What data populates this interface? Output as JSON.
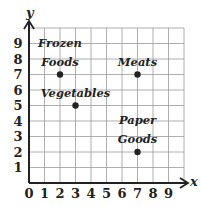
{
  "chart_data": {
    "type": "scatter",
    "title": "",
    "xlabel": "x",
    "ylabel": "y",
    "xlim": [
      0,
      10
    ],
    "ylim": [
      0,
      10
    ],
    "grid": true,
    "x_ticks": [
      "0",
      "1",
      "2",
      "3",
      "4",
      "5",
      "6",
      "7",
      "8",
      "9"
    ],
    "y_ticks": [
      "1",
      "2",
      "3",
      "4",
      "5",
      "6",
      "7",
      "8",
      "9"
    ],
    "points": [
      {
        "label_lines": [
          "Frozen",
          "Foods"
        ],
        "x": 2,
        "y": 7
      },
      {
        "label_lines": [
          "Meats"
        ],
        "x": 7,
        "y": 7
      },
      {
        "label_lines": [
          "Vegetables"
        ],
        "x": 3,
        "y": 5
      },
      {
        "label_lines": [
          "Paper",
          "Goods"
        ],
        "x": 7,
        "y": 2
      }
    ]
  },
  "colors": {
    "ink": "#222222",
    "grid": "#9a9a9a"
  }
}
